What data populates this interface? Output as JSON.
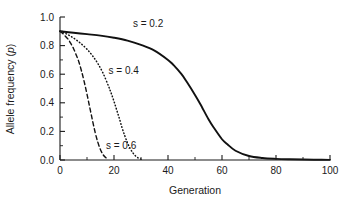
{
  "chart_data": {
    "type": "line",
    "title": "",
    "xlabel": "Generation",
    "ylabel": "Allele frequency (p)",
    "ylabel_plain": "Allele frequency (",
    "ylabel_italic": "p",
    "ylabel_close": ")",
    "xlim": [
      0,
      100
    ],
    "ylim": [
      0.0,
      1.0
    ],
    "grid": false,
    "legend_position": "inline-annotations",
    "xticks": [
      0,
      20,
      40,
      60,
      80,
      100
    ],
    "xtick_labels": [
      "0",
      "20",
      "40",
      "60",
      "80",
      "100"
    ],
    "xminor_ticks": [
      10,
      30,
      50,
      70,
      90
    ],
    "yticks": [
      0.0,
      0.2,
      0.4,
      0.6,
      0.8,
      1.0
    ],
    "ytick_labels": [
      "0.0",
      "0.2",
      "0.4",
      "0.6",
      "0.8",
      "1.0"
    ],
    "yminor_ticks": [
      0.1,
      0.3,
      0.5,
      0.7,
      0.9
    ],
    "initial_frequency": 0.9,
    "series": [
      {
        "name": "s = 0.2",
        "label": "s = 0.2",
        "style": "solid",
        "selection_coefficient": 0.2,
        "label_x": 27,
        "label_y": 0.93,
        "x": [
          0,
          5,
          10,
          15,
          20,
          25,
          30,
          35,
          40,
          42,
          45,
          47,
          50,
          52,
          55,
          57,
          60,
          62,
          65,
          70,
          75,
          80,
          85,
          90,
          95,
          100
        ],
        "values": [
          0.9,
          0.89,
          0.88,
          0.87,
          0.855,
          0.835,
          0.805,
          0.765,
          0.7,
          0.665,
          0.6,
          0.545,
          0.455,
          0.39,
          0.285,
          0.225,
          0.145,
          0.11,
          0.065,
          0.028,
          0.014,
          0.008,
          0.005,
          0.003,
          0.002,
          0.001
        ]
      },
      {
        "name": "s = 0.4",
        "label": "s = 0.4",
        "style": "dotted",
        "selection_coefficient": 0.4,
        "label_x": 18,
        "label_y": 0.6,
        "x": [
          0,
          2,
          4,
          6,
          8,
          10,
          12,
          14,
          16,
          18,
          19,
          20,
          21,
          22,
          23,
          24,
          25,
          26,
          27,
          28,
          29,
          30
        ],
        "values": [
          0.9,
          0.885,
          0.865,
          0.84,
          0.81,
          0.775,
          0.73,
          0.675,
          0.605,
          0.515,
          0.465,
          0.41,
          0.35,
          0.29,
          0.225,
          0.17,
          0.12,
          0.08,
          0.05,
          0.028,
          0.014,
          0.006
        ]
      },
      {
        "name": "s = 0.6",
        "label": "s = 0.6",
        "style": "dashed",
        "selection_coefficient": 0.6,
        "label_x": 17,
        "label_y": 0.075,
        "x": [
          0,
          1,
          2,
          3,
          4,
          5,
          6,
          7,
          8,
          9,
          10,
          11,
          12,
          13,
          14,
          15,
          16,
          17,
          18
        ],
        "values": [
          0.9,
          0.885,
          0.865,
          0.845,
          0.815,
          0.78,
          0.735,
          0.685,
          0.62,
          0.545,
          0.46,
          0.37,
          0.28,
          0.195,
          0.125,
          0.072,
          0.036,
          0.016,
          0.006
        ]
      }
    ]
  }
}
